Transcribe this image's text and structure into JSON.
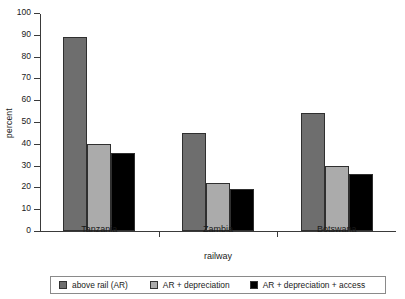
{
  "chart_data": {
    "type": "bar",
    "title": "",
    "xlabel": "railway",
    "ylabel": "percent",
    "categories": [
      "Tanzania",
      "Zambia",
      "Botswana"
    ],
    "series": [
      {
        "name": "above rail (AR)",
        "color": "#6e6e6e",
        "values": [
          89,
          45,
          54
        ]
      },
      {
        "name": "AR + depreciation",
        "color": "#ababab",
        "values": [
          40,
          22,
          30
        ]
      },
      {
        "name": "AR + depreciation + access",
        "color": "#000000",
        "values": [
          36,
          19.5,
          26
        ]
      }
    ],
    "ylim": [
      0,
      100
    ],
    "ytick_labels": [
      "0",
      "10",
      "20",
      "30",
      "40",
      "50",
      "60",
      "70",
      "80",
      "90",
      "100"
    ],
    "ytick_values": [
      0,
      10,
      20,
      30,
      40,
      50,
      60,
      70,
      80,
      90,
      100
    ],
    "grid": false,
    "legend_position": "bottom",
    "axis_color": "#3a3a3a",
    "background": "#ffffff"
  }
}
